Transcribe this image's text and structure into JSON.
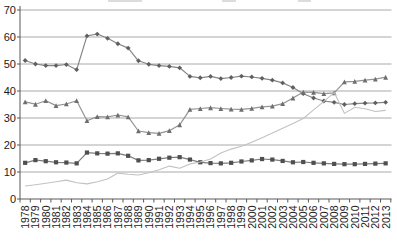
{
  "chart_data": {
    "type": "line",
    "title": "",
    "x_axis_label": "",
    "y_axis_label": "",
    "x": [
      1978,
      1979,
      1980,
      1981,
      1982,
      1983,
      1984,
      1985,
      1986,
      1987,
      1988,
      1989,
      1990,
      1991,
      1992,
      1993,
      1994,
      1995,
      1996,
      1997,
      1998,
      1999,
      2000,
      2001,
      2002,
      2003,
      2004,
      2005,
      2006,
      2007,
      2008,
      2009,
      2010,
      2011,
      2012,
      2013
    ],
    "x_tick_labels": [
      "1978",
      "1979",
      "1980",
      "1981",
      "1982",
      "1983",
      "1984",
      "1985",
      "1986",
      "1987",
      "1988",
      "1989",
      "1990",
      "1991",
      "1992",
      "1993",
      "1994",
      "1995",
      "1996",
      "1997",
      "1998",
      "1999",
      "2000",
      "2001",
      "2002",
      "2003",
      "2004",
      "2005",
      "2006",
      "2007",
      "2008",
      "2009",
      "2010",
      "2011",
      "2012",
      "2013"
    ],
    "y_tick_labels": [
      "0",
      "10",
      "20",
      "30",
      "40",
      "50",
      "60",
      "70"
    ],
    "ylim": [
      0,
      70
    ],
    "yticks": [
      0,
      10,
      20,
      30,
      40,
      50,
      60,
      70
    ],
    "grid": true,
    "legend_position": "none-visible (cropped off top edge)",
    "series": [
      {
        "name": "top line (small diamond markers, dark gray)",
        "marker": "diamond",
        "line_color": "#858585",
        "marker_color": "#5f5f5f",
        "line_width": 1.2,
        "values": [
          51.3,
          50.0,
          49.4,
          49.4,
          49.8,
          47.9,
          60.4,
          61.1,
          59.5,
          57.5,
          55.9,
          51.2,
          49.9,
          49.4,
          49.1,
          48.6,
          45.4,
          44.9,
          45.4,
          44.6,
          45.0,
          45.5,
          45.2,
          44.7,
          44.0,
          43.0,
          41.3,
          39.0,
          37.4,
          36.3,
          35.8,
          35.0,
          35.3,
          35.5,
          35.6,
          35.8
        ]
      },
      {
        "name": "second line (small triangle markers, medium gray)",
        "marker": "triangle",
        "line_color": "#949494",
        "marker_color": "#6e6e6e",
        "line_width": 1.2,
        "values": [
          36.0,
          35.1,
          36.4,
          34.6,
          35.2,
          36.4,
          29.0,
          30.5,
          30.4,
          31.1,
          30.4,
          25.2,
          24.6,
          24.3,
          25.3,
          27.5,
          33.2,
          33.5,
          33.8,
          33.5,
          33.3,
          33.2,
          33.6,
          34.1,
          34.4,
          35.3,
          37.4,
          39.6,
          39.5,
          39.0,
          39.3,
          43.4,
          43.6,
          44.0,
          44.4,
          45.1
        ]
      },
      {
        "name": "square-marker line (dark filled squares)",
        "marker": "square",
        "line_color": "#7d7d7d",
        "marker_color": "#4f4f4f",
        "line_width": 1.2,
        "values": [
          13.4,
          14.4,
          14.0,
          13.6,
          13.5,
          13.2,
          17.2,
          16.9,
          16.8,
          16.9,
          16.0,
          14.3,
          14.4,
          14.9,
          15.3,
          15.5,
          14.6,
          13.6,
          13.3,
          13.2,
          13.4,
          13.9,
          14.3,
          14.8,
          14.6,
          14.1,
          13.6,
          13.7,
          13.4,
          13.2,
          13.0,
          12.9,
          12.9,
          13.0,
          13.1,
          13.2
        ]
      },
      {
        "name": "thin light gray line (no markers, rising)",
        "marker": "none",
        "line_color": "#c2c2c2",
        "marker_color": "#c2c2c2",
        "line_width": 1.1,
        "values": [
          4.8,
          5.3,
          5.8,
          6.4,
          7.0,
          6.0,
          5.6,
          6.4,
          7.4,
          9.6,
          9.2,
          8.9,
          9.7,
          10.8,
          12.2,
          11.4,
          13.0,
          13.7,
          14.8,
          17.0,
          18.5,
          19.5,
          21.0,
          22.7,
          24.4,
          26.2,
          28.0,
          29.8,
          33.0,
          36.2,
          39.4,
          31.7,
          34.0,
          33.4,
          32.4,
          32.8
        ]
      }
    ],
    "style": {
      "gridline_color": "#aaaaaa",
      "axis_color": "#595959",
      "tick_label_color": "#1a1a1a",
      "background_color": "#ffffff"
    }
  }
}
